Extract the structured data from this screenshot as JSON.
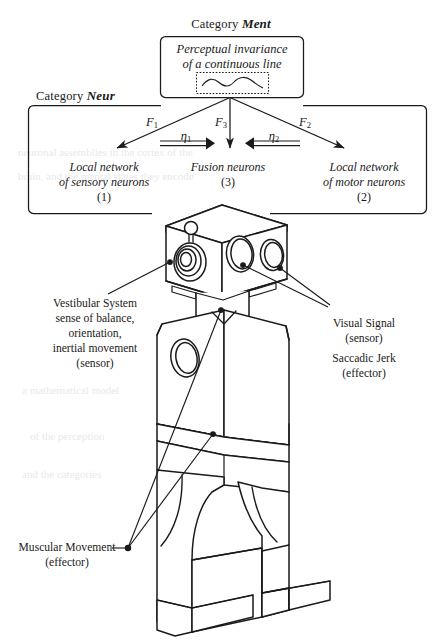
{
  "figure": {
    "type": "diagram",
    "title_visible": false,
    "categories": {
      "ment": {
        "prefix": "Category",
        "name": "Ment"
      },
      "neur": {
        "prefix": "Category",
        "name": "Neur"
      }
    },
    "ment_box": {
      "line1": "Perceptual invariance",
      "line2": "of a continuous line",
      "inner_box_content": "wavy-continuous-line-glyph"
    },
    "neur_nodes": [
      {
        "id": "sensory",
        "line1": "Local network",
        "line2": "of sensory neurons",
        "number": "(1)"
      },
      {
        "id": "fusion",
        "line1": "Fusion neurons",
        "line2": "",
        "number": "(3)"
      },
      {
        "id": "motor",
        "line1": "Local network",
        "line2": "of motor neurons",
        "number": "(2)"
      }
    ],
    "functor_arrows": [
      {
        "id": "F1",
        "symbol": "F",
        "subscript": "1",
        "from": "ment",
        "to": "sensory"
      },
      {
        "id": "F3",
        "symbol": "F",
        "subscript": "3",
        "from": "ment",
        "to": "fusion"
      },
      {
        "id": "F2",
        "symbol": "F",
        "subscript": "2",
        "from": "ment",
        "to": "motor"
      }
    ],
    "natural_transformations": [
      {
        "id": "eta1",
        "symbol": "η",
        "subscript": "1",
        "direction": "right",
        "from": "sensory",
        "to": "fusion"
      },
      {
        "id": "eta2",
        "symbol": "η",
        "subscript": "2",
        "direction": "left",
        "from": "motor",
        "to": "fusion"
      }
    ],
    "annotations": [
      {
        "id": "vestibular",
        "lines": [
          "Vestibular System",
          "sense of balance,",
          "orientation,",
          "inertial movement",
          "(sensor)"
        ],
        "points_to": "robot-head-left-sensor"
      },
      {
        "id": "visual",
        "lines": [
          "Visual Signal",
          "(sensor)"
        ],
        "points_to": "robot-head-eyes"
      },
      {
        "id": "saccadic",
        "lines": [
          "Saccadic Jerk",
          "(effector)"
        ],
        "points_to": "robot-head-eyes"
      },
      {
        "id": "muscular",
        "lines": [
          "Muscular Movement",
          "(effector)"
        ],
        "points_to": "robot-torso-and-hips"
      }
    ],
    "robot": {
      "name": "toy-robot-line-drawing",
      "parts": [
        "head",
        "neck",
        "torso",
        "waist-band",
        "hips",
        "legs",
        "feet"
      ]
    },
    "colors": {
      "ink": "#1a1a1a",
      "paper": "#ffffff",
      "bleed_through": "#ebebeb"
    }
  }
}
